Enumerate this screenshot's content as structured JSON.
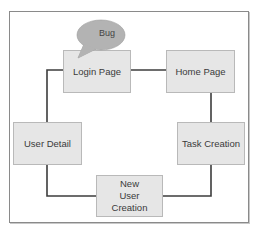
{
  "diagram": {
    "nodes": [
      {
        "id": "login",
        "label": "Login Page"
      },
      {
        "id": "home",
        "label": "Home Page"
      },
      {
        "id": "task",
        "label": "Task Creation"
      },
      {
        "id": "new_user",
        "label": "New User Creation"
      },
      {
        "id": "user_detail",
        "label": "User Detail"
      }
    ],
    "callout": {
      "label": "Bug",
      "attached_to": "Login Page"
    },
    "edges": [
      {
        "from": "Login Page",
        "to": "Home Page"
      },
      {
        "from": "Home Page",
        "to": "Task Creation"
      },
      {
        "from": "Task Creation",
        "to": "New User Creation"
      },
      {
        "from": "New User Creation",
        "to": "User Detail"
      },
      {
        "from": "User Detail",
        "to": "Login Page"
      }
    ],
    "colors": {
      "node_fill": "#e6e6e6",
      "node_border": "#b9b9b9",
      "callout_fill": "#b3b3b3",
      "connector": "#3c3c3c",
      "frame_border": "#8a8a8a"
    }
  }
}
